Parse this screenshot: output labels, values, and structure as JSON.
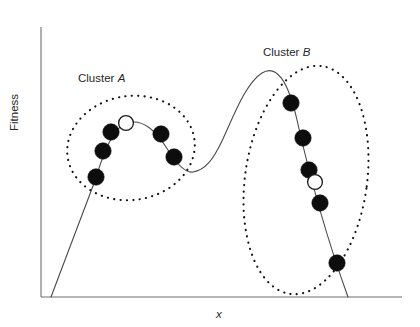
{
  "figure": {
    "background_color": "#ffffff",
    "width": 420,
    "height": 327
  },
  "axes": {
    "y_label": "Fitness",
    "x_label": "x",
    "axis_color": "#6e6e6e",
    "origin_x": 41,
    "baseline_y": 297,
    "top_y": 27,
    "right_x": 402
  },
  "annotations": [
    {
      "id": "cluster-a",
      "prefix": "Cluster ",
      "symbol": "A",
      "x": 78,
      "y": 73
    },
    {
      "id": "cluster-b",
      "prefix": "Cluster ",
      "symbol": "B",
      "x": 263,
      "y": 47
    }
  ],
  "chart_data": {
    "type": "line",
    "xlabel": "x",
    "ylabel": "Fitness",
    "grid": false,
    "legend": null,
    "axis_ticks": [],
    "curve_color": "#4a4a4a",
    "curve_description": "Bimodal fitness landscape: steep rise to a lower-left local optimum, a valley, then a taller global optimum on the right that descends steeply to the baseline.",
    "curve_path": "M 51 297 L 96 178 C 104 150 114 127 127 123 C 143 118 156 131 168 150 C 178 166 186 173 193 172 C 205 170 213 160 222 141 C 234 115 246 83 262 73 C 276 64 288 80 297 120 C 306 160 322 225 348 297",
    "landmarks": {
      "curve_start": [
        51,
        297
      ],
      "peak_a": [
        131,
        122
      ],
      "valley": [
        193,
        172
      ],
      "peak_b": [
        266,
        71
      ],
      "curve_end": [
        348,
        297
      ]
    },
    "series": [
      {
        "name": "Cluster A population",
        "marker": "circle",
        "points": [
          {
            "x": 96,
            "y": 177,
            "fill": "filled"
          },
          {
            "x": 103,
            "y": 151,
            "fill": "filled"
          },
          {
            "x": 111,
            "y": 132,
            "fill": "filled"
          },
          {
            "x": 126,
            "y": 123,
            "fill": "open"
          },
          {
            "x": 161,
            "y": 134,
            "fill": "filled"
          },
          {
            "x": 174,
            "y": 157,
            "fill": "filled"
          }
        ]
      },
      {
        "name": "Cluster B population",
        "marker": "circle",
        "points": [
          {
            "x": 291,
            "y": 103,
            "fill": "filled"
          },
          {
            "x": 303,
            "y": 138,
            "fill": "filled"
          },
          {
            "x": 309,
            "y": 170,
            "fill": "filled"
          },
          {
            "x": 315,
            "y": 182,
            "fill": "open"
          },
          {
            "x": 320,
            "y": 203,
            "fill": "filled"
          },
          {
            "x": 337,
            "y": 263,
            "fill": "filled"
          }
        ]
      }
    ],
    "cluster_outlines": [
      {
        "name": "Cluster A outline",
        "shape": "ellipse",
        "cx": 131,
        "cy": 148,
        "rx": 64,
        "ry": 52,
        "rotation": -8,
        "style": "dotted"
      },
      {
        "name": "Cluster B outline",
        "shape": "ellipse",
        "cx": 306,
        "cy": 180,
        "rx": 61,
        "ry": 115,
        "rotation": 8,
        "style": "dotted"
      }
    ]
  }
}
